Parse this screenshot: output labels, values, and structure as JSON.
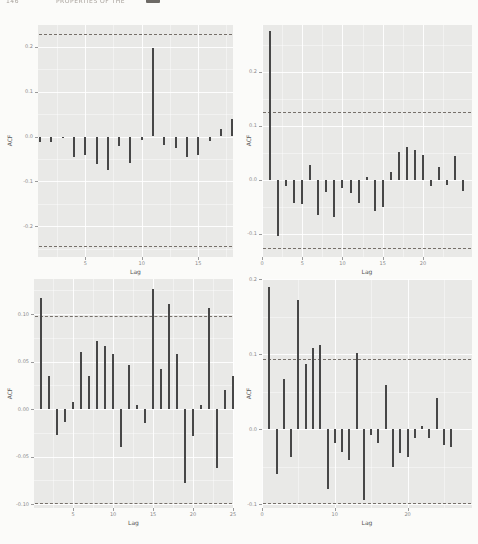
{
  "header": {
    "page_fragment": "146",
    "caption_fragment": "PROPERTIES OF THE"
  },
  "colors": {
    "page_background": "#fbfbf9",
    "panel_background": "#e9e9e7",
    "bar": "#474747",
    "confidence_dash": "#76706a",
    "gridline": "#ffffff",
    "tick_text": "#8a8a8a",
    "axis_title_text": "#555555"
  },
  "chart_data": [
    {
      "id": "top-left",
      "type": "bar",
      "title": "",
      "xlabel": "Lag",
      "ylabel": "ACF",
      "lags": [
        1,
        2,
        3,
        4,
        5,
        6,
        7,
        8,
        9,
        10,
        11,
        12,
        13,
        14,
        15,
        16,
        17,
        18
      ],
      "values": [
        -0.012,
        -0.012,
        -0.003,
        -0.045,
        -0.042,
        -0.062,
        -0.075,
        -0.022,
        -0.058,
        -0.008,
        0.196,
        -0.02,
        -0.025,
        -0.045,
        -0.042,
        -0.01,
        0.016,
        0.038
      ],
      "conf_upper": 0.228,
      "conf_lower": -0.244,
      "ylim": [
        -0.268,
        0.248
      ],
      "xlim": [
        0.82,
        18.08
      ],
      "yticks": {
        "values": [
          0.2,
          0.1,
          0.0,
          -0.1,
          -0.2
        ],
        "labels": [
          "0.2",
          "0.1",
          "0.0",
          "-0.1",
          "-0.2"
        ]
      },
      "xticks": {
        "values": [
          5,
          10,
          15
        ],
        "labels": [
          "5",
          "10",
          "15"
        ]
      },
      "grid": true,
      "legend": "none",
      "layout": {
        "cell": [
          0,
          10,
          239,
          266
        ],
        "panel": [
          38,
          15,
          195,
          232
        ]
      }
    },
    {
      "id": "top-right",
      "type": "bar",
      "title": "",
      "xlabel": "Lag",
      "ylabel": "ACF",
      "lags": [
        1,
        2,
        3,
        4,
        5,
        6,
        7,
        8,
        9,
        10,
        11,
        12,
        13,
        14,
        15,
        16,
        17,
        18,
        19,
        20,
        21,
        22,
        23,
        24,
        25
      ],
      "values": [
        0.275,
        -0.105,
        -0.012,
        -0.042,
        -0.045,
        0.028,
        -0.065,
        -0.022,
        -0.068,
        -0.015,
        -0.025,
        -0.042,
        0.006,
        -0.057,
        -0.05,
        0.014,
        0.052,
        0.06,
        0.055,
        0.046,
        -0.012,
        0.024,
        -0.01,
        0.045,
        -0.02
      ],
      "conf_upper": 0.125,
      "conf_lower": -0.126,
      "ylim": [
        -0.143,
        0.287
      ],
      "xlim": [
        0,
        26.1
      ],
      "yticks": {
        "values": [
          0.2,
          0.1,
          0.0,
          -0.1
        ],
        "labels": [
          "0.2",
          "0.1",
          "0.0",
          "-0.1"
        ]
      },
      "xticks": {
        "values": [
          0,
          5,
          10,
          15,
          20
        ],
        "labels": [
          "0",
          "5",
          "10",
          "15",
          "20"
        ]
      },
      "grid": true,
      "legend": "none",
      "layout": {
        "cell": [
          239,
          10,
          239,
          266
        ],
        "panel": [
          23,
          15,
          210,
          232
        ]
      }
    },
    {
      "id": "bottom-left",
      "type": "bar",
      "title": "",
      "xlabel": "Lag",
      "ylabel": "ACF",
      "lags": [
        1,
        2,
        3,
        4,
        5,
        6,
        7,
        8,
        9,
        10,
        11,
        12,
        13,
        14,
        15,
        16,
        17,
        18,
        19,
        20,
        21,
        22,
        23,
        24,
        25
      ],
      "values": [
        0.117,
        0.035,
        -0.027,
        -0.013,
        0.008,
        0.06,
        0.035,
        0.072,
        0.066,
        0.058,
        -0.04,
        0.047,
        0.004,
        -0.015,
        0.127,
        0.042,
        0.111,
        0.058,
        -0.078,
        -0.028,
        0.004,
        0.107,
        -0.062,
        0.02,
        0.035
      ],
      "conf_upper": 0.098,
      "conf_lower": -0.099,
      "ylim": [
        -0.104,
        0.137
      ],
      "xlim": [
        0.1,
        25
      ],
      "yticks": {
        "values": [
          0.1,
          0.05,
          0.0,
          -0.05,
          -0.1
        ],
        "labels": [
          "0.10",
          "0.05",
          "0.00",
          "-0.05",
          "-0.10"
        ]
      },
      "xticks": {
        "values": [
          0,
          5,
          10,
          15,
          20,
          25
        ],
        "labels": [
          "0",
          "5",
          "10",
          "15",
          "20",
          "25"
        ]
      },
      "grid": true,
      "legend": "none",
      "layout": {
        "cell": [
          0,
          276,
          239,
          268
        ],
        "panel": [
          34,
          3,
          199,
          229
        ]
      }
    },
    {
      "id": "bottom-right",
      "type": "bar",
      "title": "",
      "xlabel": "Lag",
      "ylabel": "ACF",
      "lags": [
        1,
        2,
        3,
        4,
        5,
        6,
        7,
        8,
        9,
        10,
        11,
        12,
        13,
        14,
        15,
        16,
        17,
        18,
        19,
        20,
        21,
        22,
        23,
        24,
        25,
        26
      ],
      "values": [
        0.19,
        -0.06,
        0.067,
        -0.037,
        0.172,
        0.087,
        0.108,
        0.112,
        -0.08,
        -0.018,
        -0.03,
        -0.041,
        0.101,
        -0.095,
        -0.008,
        -0.018,
        0.059,
        -0.05,
        -0.032,
        -0.037,
        -0.012,
        0.004,
        -0.012,
        0.041,
        -0.021,
        -0.024
      ],
      "conf_upper": 0.094,
      "conf_lower": -0.099,
      "ylim": [
        -0.105,
        0.2
      ],
      "xlim": [
        0,
        28.85
      ],
      "yticks": {
        "values": [
          0.2,
          0.1,
          0.0,
          -0.1
        ],
        "labels": [
          "0.2",
          "0.1",
          "0.0",
          "-0.1"
        ]
      },
      "xticks": {
        "values": [
          0,
          10,
          20
        ],
        "labels": [
          "0",
          "10",
          "20"
        ]
      },
      "grid": true,
      "legend": "none",
      "layout": {
        "cell": [
          239,
          276,
          239,
          268
        ],
        "panel": [
          23,
          3,
          210,
          229
        ]
      }
    }
  ]
}
